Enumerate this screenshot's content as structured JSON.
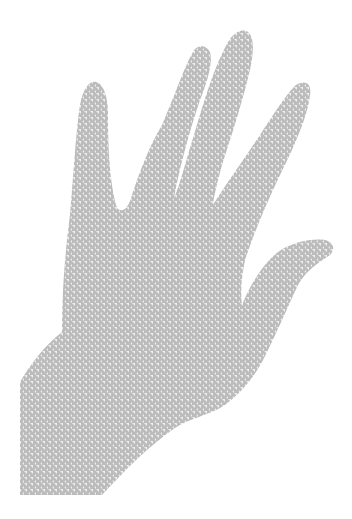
{
  "image": {
    "subject": "Hand silhouette with houndstooth pattern",
    "background_color": "#ffffff",
    "pattern": {
      "type": "houndstooth",
      "dark_color": "#bdbdbd",
      "light_color": "#efefef",
      "period_px": 6
    }
  }
}
